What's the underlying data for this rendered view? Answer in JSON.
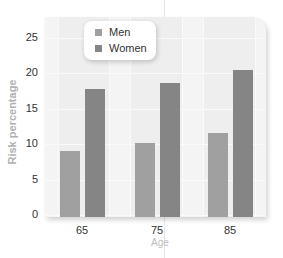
{
  "chart_data": {
    "type": "bar",
    "title": "",
    "xlabel": "Age",
    "ylabel": "Risk percentage",
    "categories": [
      "65",
      "75",
      "85"
    ],
    "series": [
      {
        "name": "Men",
        "values": [
          9.3,
          10.4,
          11.8
        ],
        "color": "#a0a0a0"
      },
      {
        "name": "Women",
        "values": [
          18.0,
          18.9,
          20.7
        ],
        "color": "#858585"
      }
    ],
    "ylim": [
      0,
      28
    ],
    "yticks": [
      "0",
      "5",
      "10",
      "15",
      "20",
      "25"
    ],
    "grid": true,
    "legend_position": "upper-left inside"
  },
  "legend": {
    "items": [
      {
        "label": "Men",
        "color": "#a0a0a0"
      },
      {
        "label": "Women",
        "color": "#858585"
      }
    ]
  },
  "axes": {
    "xlabel": "Age",
    "ylabel": "Risk percentage"
  }
}
